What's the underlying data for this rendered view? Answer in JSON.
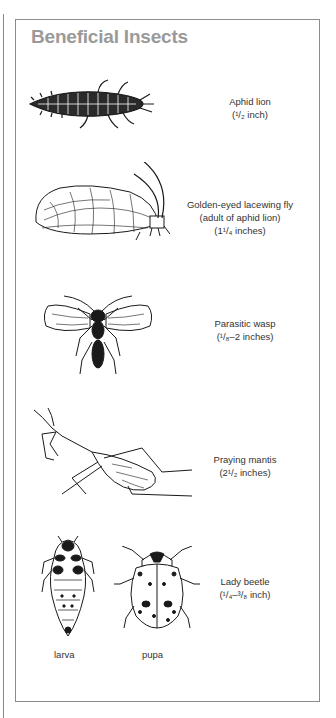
{
  "title": "Beneficial Insects",
  "insects": [
    {
      "name": "Aphid lion",
      "size_lines": [
        "(¹/₂ inch)"
      ],
      "illustration": "aphid-lion-larva"
    },
    {
      "name": "Golden-eyed lacewing fly",
      "size_lines": [
        "(adult of aphid lion)",
        "(1¹/₄ inches)"
      ],
      "illustration": "lacewing-fly"
    },
    {
      "name": "Parasitic wasp",
      "size_lines": [
        "(¹/₈–2 inches)"
      ],
      "illustration": "parasitic-wasp"
    },
    {
      "name": "Praying mantis",
      "size_lines": [
        "(2¹/₂ inches)"
      ],
      "illustration": "praying-mantis"
    },
    {
      "name": "Lady beetle",
      "size_lines": [
        "(¹/₄–³/₈ inch)"
      ],
      "illustration": "lady-beetle"
    }
  ],
  "lady_beetle_stages": [
    "larva",
    "pupa"
  ],
  "colors": {
    "title": "#9a9a9a",
    "border": "#8c8c8c",
    "text": "#333333",
    "ink": "#1a1a1a"
  }
}
